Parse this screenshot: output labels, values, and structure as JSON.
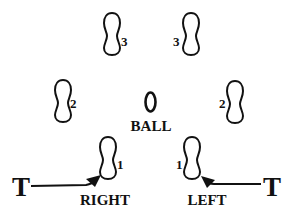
{
  "diagram": {
    "type": "footwork-drill",
    "ball_label": "BALL",
    "ball_symbol": "0",
    "footprints": [
      {
        "id": "right-1",
        "step": "1",
        "side": "right"
      },
      {
        "id": "left-1",
        "step": "1",
        "side": "left"
      },
      {
        "id": "right-2",
        "step": "2",
        "side": "right"
      },
      {
        "id": "left-2",
        "step": "2",
        "side": "left"
      },
      {
        "id": "right-3",
        "step": "3",
        "side": "right"
      },
      {
        "id": "left-3",
        "step": "3",
        "side": "left"
      }
    ],
    "start_markers": [
      {
        "id": "t-left",
        "label": "T",
        "foot_label": "RIGHT"
      },
      {
        "id": "t-right",
        "label": "T",
        "foot_label": "LEFT"
      }
    ],
    "colors": {
      "ink": "#111111",
      "background": "#ffffff"
    }
  }
}
